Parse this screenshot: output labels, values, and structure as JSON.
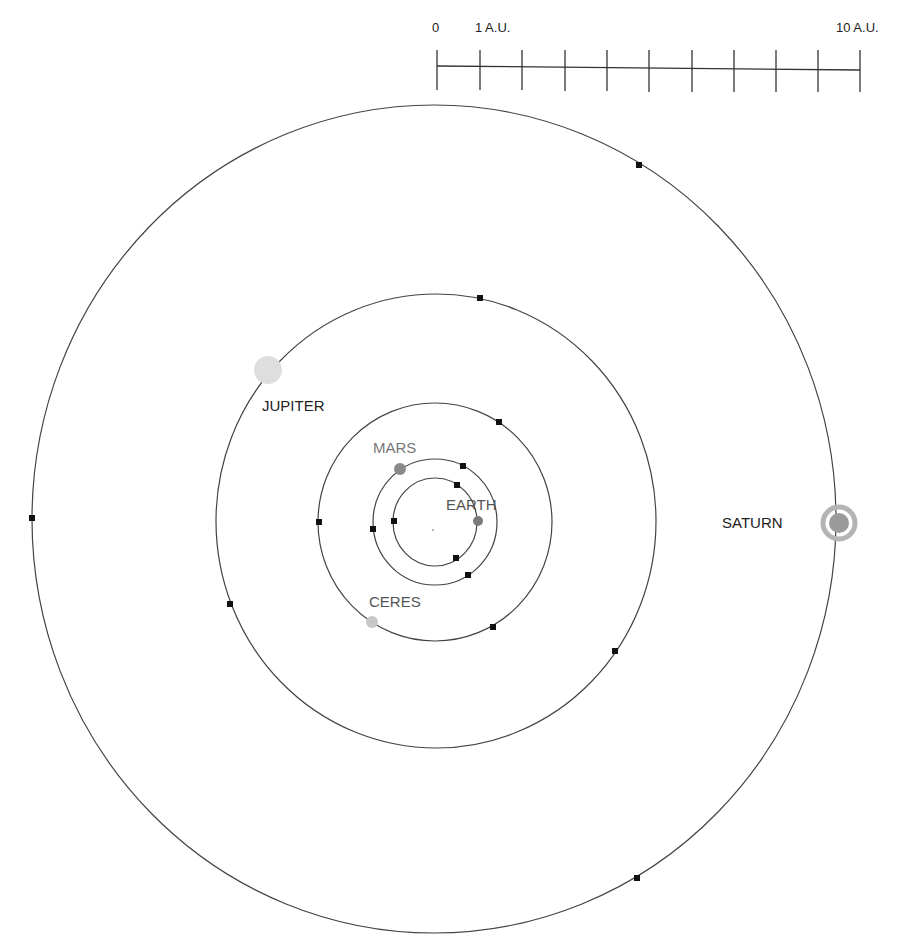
{
  "scale_bar": {
    "label_start": "0",
    "label_unit": "1 A.U.",
    "label_end": "10 A.U.",
    "ticks": 11
  },
  "center": {
    "x": 434,
    "y": 521
  },
  "orbits": [
    {
      "name": "Earth",
      "rx": 42,
      "ry": 44
    },
    {
      "name": "Mars",
      "rx": 62,
      "ry": 63
    },
    {
      "name": "Ceres",
      "rx": 117,
      "ry": 119
    },
    {
      "name": "Jupiter",
      "rx": 220,
      "ry": 227
    },
    {
      "name": "Saturn",
      "rx": 402,
      "ry": 414
    }
  ],
  "planets": {
    "earth": {
      "label": "EARTH",
      "color": "#7a7a7a"
    },
    "mars": {
      "label": "MARS",
      "color": "#8a8a8a"
    },
    "ceres": {
      "label": "CERES",
      "color": "#c8c8c8"
    },
    "jupiter": {
      "label": "JUPITER",
      "color": "#dedede"
    },
    "saturn": {
      "label": "SATURN",
      "color": "#9a9a9a",
      "ring_color": "#b4b4b4"
    }
  },
  "markers": [
    {
      "orbit": "Earth",
      "x": 457,
      "y": 485
    },
    {
      "orbit": "Earth",
      "x": 394,
      "y": 521
    },
    {
      "orbit": "Earth",
      "x": 456,
      "y": 558
    },
    {
      "orbit": "Mars",
      "x": 463,
      "y": 466
    },
    {
      "orbit": "Mars",
      "x": 373,
      "y": 529
    },
    {
      "orbit": "Mars",
      "x": 468,
      "y": 575
    },
    {
      "orbit": "Ceres",
      "x": 499,
      "y": 422
    },
    {
      "orbit": "Ceres",
      "x": 319,
      "y": 522
    },
    {
      "orbit": "Ceres",
      "x": 493,
      "y": 627
    },
    {
      "orbit": "Jupiter",
      "x": 480,
      "y": 298
    },
    {
      "orbit": "Jupiter",
      "x": 230,
      "y": 604
    },
    {
      "orbit": "Jupiter",
      "x": 615,
      "y": 651
    },
    {
      "orbit": "Saturn",
      "x": 639,
      "y": 165
    },
    {
      "orbit": "Saturn",
      "x": 32,
      "y": 518
    },
    {
      "orbit": "Saturn",
      "x": 637,
      "y": 878
    }
  ]
}
